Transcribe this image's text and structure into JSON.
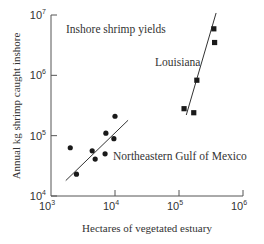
{
  "chart_data": {
    "type": "scatter",
    "title": "Inshore shrimp yields",
    "xlabel": "Hectares of vegetated estuary",
    "ylabel": "Annual kg shrimp caught inshore",
    "xscale": "log",
    "yscale": "log",
    "xlim": [
      1000,
      1000000
    ],
    "ylim": [
      10000,
      10000000
    ],
    "x_ticks": [
      {
        "value": 1000,
        "base": "10",
        "exp": "3"
      },
      {
        "value": 10000,
        "base": "10",
        "exp": "4"
      },
      {
        "value": 100000,
        "base": "10",
        "exp": "5"
      },
      {
        "value": 1000000,
        "base": "10",
        "exp": "6"
      }
    ],
    "y_ticks": [
      {
        "value": 10000,
        "base": "10",
        "exp": "4"
      },
      {
        "value": 100000,
        "base": "10",
        "exp": "5"
      },
      {
        "value": 1000000,
        "base": "10",
        "exp": "6"
      },
      {
        "value": 10000000,
        "base": "10",
        "exp": "7"
      }
    ],
    "grid": false,
    "series": [
      {
        "name": "Northeastern Gulf of Mexico",
        "marker": "circle",
        "points": [
          {
            "x": 10000,
            "y": 210000
          },
          {
            "x": 7200,
            "y": 110000
          },
          {
            "x": 9600,
            "y": 89000
          },
          {
            "x": 2000,
            "y": 63000
          },
          {
            "x": 4400,
            "y": 56000
          },
          {
            "x": 4900,
            "y": 41000
          },
          {
            "x": 7000,
            "y": 50000
          },
          {
            "x": 2500,
            "y": 23000
          }
        ],
        "fit_line": [
          {
            "x": 1700,
            "y": 18000
          },
          {
            "x": 16000,
            "y": 180000
          }
        ]
      },
      {
        "name": "Louisiana",
        "marker": "square",
        "points": [
          {
            "x": 350000,
            "y": 5900000
          },
          {
            "x": 360000,
            "y": 3500000
          },
          {
            "x": 190000,
            "y": 830000
          },
          {
            "x": 120000,
            "y": 280000
          },
          {
            "x": 170000,
            "y": 240000
          }
        ],
        "fit_line": [
          {
            "x": 130000,
            "y": 220000
          },
          {
            "x": 380000,
            "y": 10800000
          }
        ]
      }
    ],
    "annotations": [
      "Inshore shrimp yields",
      "Louisiana",
      "Northeastern Gulf of Mexico"
    ],
    "legend": "none"
  }
}
